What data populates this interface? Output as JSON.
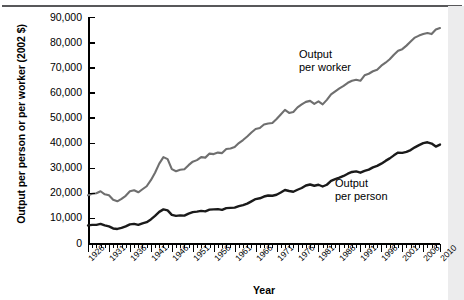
{
  "chart_data": {
    "type": "line",
    "title": "",
    "xlabel": "Year",
    "ylabel": "Output per person or per worker (2002 $)",
    "xlim": [
      1926,
      2010
    ],
    "ylim": [
      0,
      90000
    ],
    "yticks": [
      0,
      10000,
      20000,
      30000,
      40000,
      50000,
      60000,
      70000,
      80000,
      90000
    ],
    "ytick_labels": [
      "0",
      "10,000",
      "20,000",
      "30,000",
      "40,000",
      "50,000",
      "60,000",
      "70,000",
      "80,000",
      "90,000"
    ],
    "xtick_labels": [
      "1926",
      "1931",
      "1936",
      "1941",
      "1946",
      "1951",
      "1956",
      "1961",
      "1966",
      "1971",
      "1976",
      "1981",
      "1986",
      "1991",
      "1996",
      "2001",
      "2006",
      "2010"
    ],
    "xtick_interval_minor": 1,
    "xtick_interval_major": 5,
    "grid": false,
    "legend_position": "inline-annotation",
    "annotations": [
      {
        "text": "Output\nper worker",
        "series": "Output per worker",
        "x": 1980,
        "y": 62000
      },
      {
        "text": "Output\nper person",
        "series": "Output per person",
        "x": 1992,
        "y": 20000
      }
    ],
    "colors": {
      "output_per_worker": "#6f6f6f",
      "output_per_person": "#1a1a1a"
    },
    "x": [
      1926,
      1927,
      1928,
      1929,
      1930,
      1931,
      1932,
      1933,
      1934,
      1935,
      1936,
      1937,
      1938,
      1939,
      1940,
      1941,
      1942,
      1943,
      1944,
      1945,
      1946,
      1947,
      1948,
      1949,
      1950,
      1951,
      1952,
      1953,
      1954,
      1955,
      1956,
      1957,
      1958,
      1959,
      1960,
      1961,
      1962,
      1963,
      1964,
      1965,
      1966,
      1967,
      1968,
      1969,
      1970,
      1971,
      1972,
      1973,
      1974,
      1975,
      1976,
      1977,
      1978,
      1979,
      1980,
      1981,
      1982,
      1983,
      1984,
      1985,
      1986,
      1987,
      1988,
      1989,
      1990,
      1991,
      1992,
      1993,
      1994,
      1995,
      1996,
      1997,
      1998,
      1999,
      2000,
      2001,
      2002,
      2003,
      2004,
      2005,
      2006,
      2007,
      2008,
      2009,
      2010
    ],
    "series": [
      {
        "name": "Output per worker",
        "color": "#6f6f6f",
        "values": [
          19000,
          19600,
          19800,
          20600,
          19400,
          19000,
          17200,
          16600,
          17600,
          18800,
          20600,
          21000,
          20200,
          21400,
          22600,
          25000,
          28000,
          31600,
          34200,
          33400,
          29400,
          28600,
          29200,
          29400,
          31000,
          32400,
          33000,
          34200,
          34000,
          35600,
          35400,
          36000,
          35800,
          37400,
          37600,
          38200,
          39800,
          41000,
          42400,
          44000,
          45400,
          45800,
          47200,
          47600,
          47800,
          49400,
          51200,
          53000,
          51800,
          52200,
          54000,
          55200,
          56200,
          56600,
          55400,
          56400,
          55200,
          57000,
          59200,
          60400,
          61600,
          62600,
          63800,
          64600,
          65000,
          64600,
          66800,
          67400,
          68400,
          69000,
          70600,
          71800,
          73200,
          75000,
          76600,
          77200,
          78600,
          80200,
          81800,
          82600,
          83200,
          83600,
          83200,
          85000,
          85600
        ],
        "values_note": "Real output per worker in 2002 dollars"
      },
      {
        "name": "Output per person",
        "color": "#1a1a1a",
        "values": [
          7000,
          7200,
          7200,
          7600,
          7000,
          6600,
          5800,
          5600,
          6000,
          6600,
          7400,
          7600,
          7200,
          7800,
          8300,
          9400,
          10800,
          12400,
          13400,
          13000,
          11200,
          10800,
          11000,
          10900,
          11700,
          12300,
          12500,
          12800,
          12600,
          13300,
          13400,
          13500,
          13200,
          13900,
          14000,
          14100,
          14700,
          15100,
          15700,
          16600,
          17500,
          17800,
          18500,
          18900,
          18800,
          19200,
          20100,
          21100,
          20700,
          20400,
          21200,
          21900,
          22900,
          23300,
          22800,
          23200,
          22500,
          23200,
          24700,
          25400,
          26000,
          26700,
          27600,
          28300,
          28500,
          28000,
          28700,
          29200,
          30100,
          30700,
          31600,
          32700,
          33700,
          34900,
          36000,
          35900,
          36300,
          37000,
          38100,
          39000,
          39800,
          40100,
          39600,
          38400,
          39200
        ],
        "values_note": "Real output per person in 2002 dollars"
      }
    ]
  },
  "axis": {
    "x_title": "Year",
    "y_title": "Output per person or per worker (2002 $)"
  },
  "annotations": {
    "worker_line1": "Output",
    "worker_line2": "per worker",
    "person_line1": "Output",
    "person_line2": "per person"
  }
}
